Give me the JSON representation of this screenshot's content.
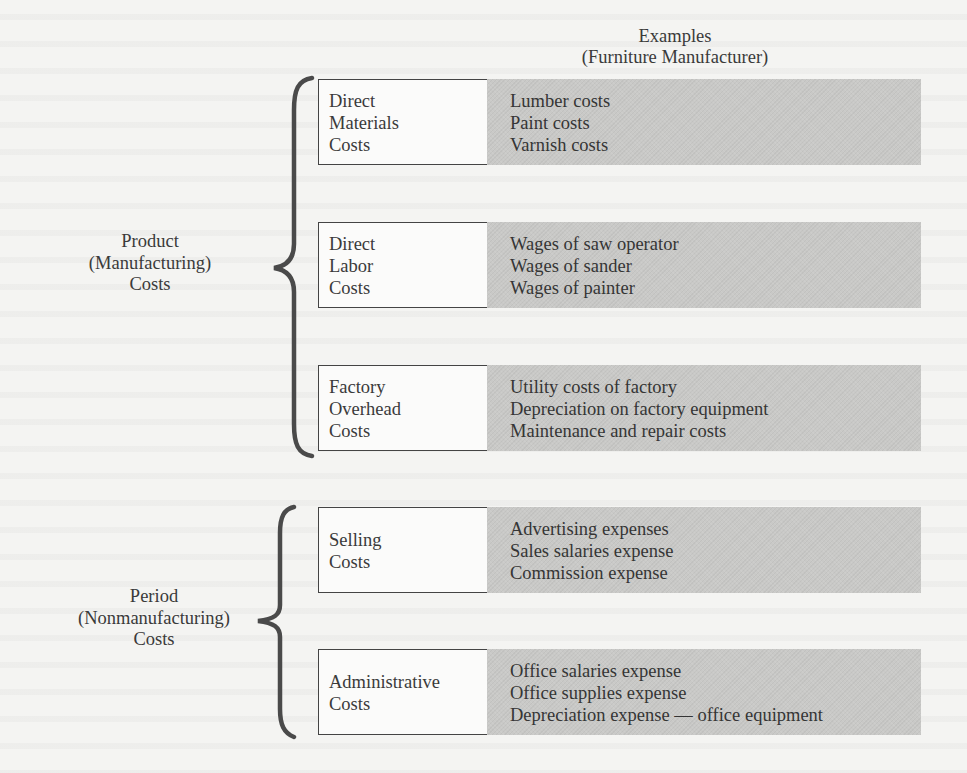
{
  "header": {
    "line1": "Examples",
    "line2": "(Furniture Manufacturer)"
  },
  "groups": [
    {
      "label": [
        "Product",
        "(Manufacturing)",
        "Costs"
      ],
      "categories": [
        {
          "label": [
            "Direct",
            "Materials",
            "Costs"
          ],
          "examples": [
            "Lumber costs",
            "Paint costs",
            "Varnish costs"
          ]
        },
        {
          "label": [
            "Direct",
            "Labor",
            "Costs"
          ],
          "examples": [
            "Wages of saw operator",
            "Wages of sander",
            "Wages of painter"
          ]
        },
        {
          "label": [
            "Factory",
            "Overhead",
            "Costs"
          ],
          "examples": [
            "Utility costs of factory",
            "Depreciation on factory equipment",
            "Maintenance and repair costs"
          ]
        }
      ]
    },
    {
      "label": [
        "Period",
        "(Nonmanufacturing)",
        "Costs"
      ],
      "categories": [
        {
          "label": [
            "Selling",
            "Costs"
          ],
          "examples": [
            "Advertising expenses",
            "Sales salaries expense",
            "Commission expense"
          ]
        },
        {
          "label": [
            "Administrative",
            "Costs"
          ],
          "examples": [
            "Office salaries expense",
            "Office supplies expense",
            "Depreciation expense — office equipment"
          ]
        }
      ]
    }
  ],
  "colors": {
    "text": "#3a3a3a",
    "example_fill": "#c9c9c7",
    "box_border": "#444444",
    "brace": "#4a4a4a",
    "paper": "#f4f4f2"
  }
}
